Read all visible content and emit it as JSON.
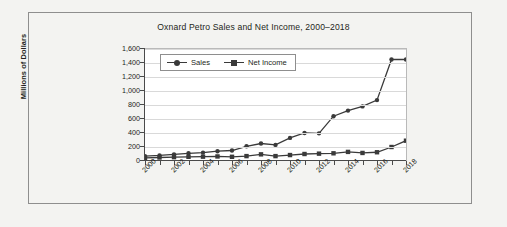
{
  "chart_data": {
    "type": "line",
    "title": "Oxnard Petro Sales and Net Income, 2000–2018",
    "xlabel": "",
    "ylabel": "Millions of Dollars",
    "ylim": [
      0,
      1600
    ],
    "ytick_values": [
      0,
      200,
      400,
      600,
      800,
      1000,
      1200,
      1400,
      1600
    ],
    "ytick_labels": [
      "0",
      "200",
      "400",
      "600",
      "800",
      "1,000",
      "1,200",
      "1,400",
      "1,600"
    ],
    "grid": true,
    "legend_position": "top-left-inside",
    "x": [
      2000,
      2001,
      2002,
      2003,
      2004,
      2005,
      2006,
      2007,
      2008,
      2009,
      2010,
      2011,
      2012,
      2013,
      2014,
      2015,
      2016,
      2017,
      2018
    ],
    "xtick_labels": [
      "2000",
      "2002",
      "2004",
      "2006",
      "2008",
      "2010",
      "2012",
      "2014",
      "2016",
      "2018"
    ],
    "xtick_label_years": [
      2000,
      2002,
      2004,
      2006,
      2008,
      2010,
      2012,
      2014,
      2016,
      2018
    ],
    "series": [
      {
        "name": "Sales",
        "marker": "circle",
        "color": "#3a3a3a",
        "values": [
          70,
          80,
          95,
          110,
          120,
          140,
          150,
          210,
          250,
          230,
          330,
          400,
          395,
          640,
          720,
          780,
          870,
          1450,
          1450
        ]
      },
      {
        "name": "Net Income",
        "marker": "square",
        "color": "#3a3a3a",
        "values": [
          45,
          50,
          55,
          60,
          62,
          65,
          60,
          70,
          95,
          70,
          85,
          100,
          105,
          110,
          130,
          115,
          125,
          200,
          290
        ]
      }
    ]
  },
  "legend": {
    "items": [
      {
        "label": "Sales",
        "marker": "circle"
      },
      {
        "label": "Net Income",
        "marker": "square"
      }
    ]
  }
}
